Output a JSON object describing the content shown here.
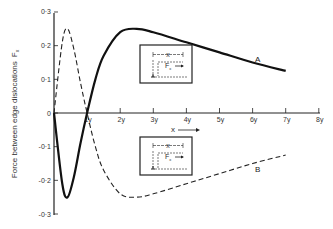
{
  "chart_data": {
    "type": "line",
    "title": "",
    "xlabel": "x",
    "ylabel": "Force between edge dislocations F_x",
    "xlim": [
      0,
      8
    ],
    "ylim": [
      -0.3,
      0.3
    ],
    "x_ticks": [
      "1y",
      "2y",
      "3y",
      "4y",
      "5y",
      "6y",
      "7y",
      "8y"
    ],
    "y_ticks": [
      "0·3",
      "0·2",
      "0·1",
      "0",
      "-0·1",
      "-0·2",
      "-0·3"
    ],
    "series": [
      {
        "name": "A",
        "style": "solid",
        "x": [
          0,
          0.25,
          0.41,
          0.6,
          0.8,
          1.0,
          1.25,
          1.5,
          2.0,
          2.5,
          3.0,
          4.0,
          5.0,
          6.0,
          7.0
        ],
        "values": [
          0,
          -0.21,
          -0.25,
          -0.19,
          -0.09,
          0,
          0.1,
          0.17,
          0.24,
          0.25,
          0.24,
          0.21,
          0.18,
          0.15,
          0.125
        ]
      },
      {
        "name": "B",
        "style": "dashed",
        "x": [
          0,
          0.25,
          0.41,
          0.6,
          0.8,
          1.0,
          1.25,
          1.5,
          2.0,
          2.5,
          3.0,
          4.0,
          5.0,
          6.0,
          7.0
        ],
        "values": [
          0,
          0.21,
          0.25,
          0.19,
          0.09,
          0,
          -0.1,
          -0.17,
          -0.24,
          -0.25,
          -0.24,
          -0.21,
          -0.18,
          -0.15,
          -0.125
        ]
      }
    ],
    "annotations": [
      "A",
      "B",
      "x →",
      "inset diagram: dislocation separation x, force F_x"
    ],
    "grid": false,
    "legend": "none (curves labeled A and B directly)"
  },
  "labels": {
    "ylabel": "Force between edge dislocations",
    "ylabel_sym": "F",
    "ylabel_sub": "x",
    "xlabel": "x",
    "curve_a": "A",
    "curve_b": "B",
    "inset_x": "x",
    "inset_f": "F",
    "inset_f_sub": "x"
  }
}
